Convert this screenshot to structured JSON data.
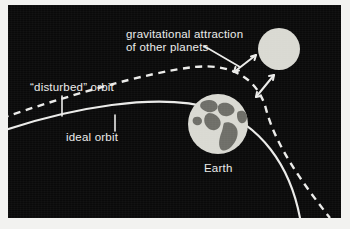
{
  "figure": {
    "background_color": "#0a0a0a",
    "line_color": "#ececea",
    "body_color": "#d9d9d2",
    "continent_color": "#6e6e68"
  },
  "labels": {
    "gravitational_line1": "gravitational attraction",
    "gravitational_line2": "of other planets",
    "disturbed_orbit": "“disturbed” orbit",
    "ideal_orbit": "ideal orbit",
    "earth": "Earth"
  },
  "bodies": [
    {
      "name": "earth",
      "label": "Earth",
      "cx": 210,
      "cy": 119,
      "r": 30,
      "has_continents": true
    },
    {
      "name": "other-planet",
      "label": "",
      "cx": 271,
      "cy": 44,
      "r": 21,
      "has_continents": false
    }
  ],
  "orbits": [
    {
      "name": "ideal-orbit",
      "style": "solid",
      "label": "ideal orbit"
    },
    {
      "name": "disturbed-orbit",
      "style": "dashed",
      "label": "“disturbed” orbit"
    }
  ],
  "arrows": [
    {
      "name": "gravity-arrow-upper",
      "double_headed": true
    },
    {
      "name": "gravity-arrow-lower",
      "double_headed": true
    }
  ],
  "leader_lines": [
    {
      "name": "leader-gravitational",
      "from": "gravitational-label",
      "to": "gravity-arrow-upper"
    },
    {
      "name": "leader-disturbed",
      "from": "disturbed-label",
      "to": "disturbed-orbit"
    },
    {
      "name": "leader-ideal",
      "from": "ideal-label",
      "to": "ideal-orbit"
    }
  ]
}
